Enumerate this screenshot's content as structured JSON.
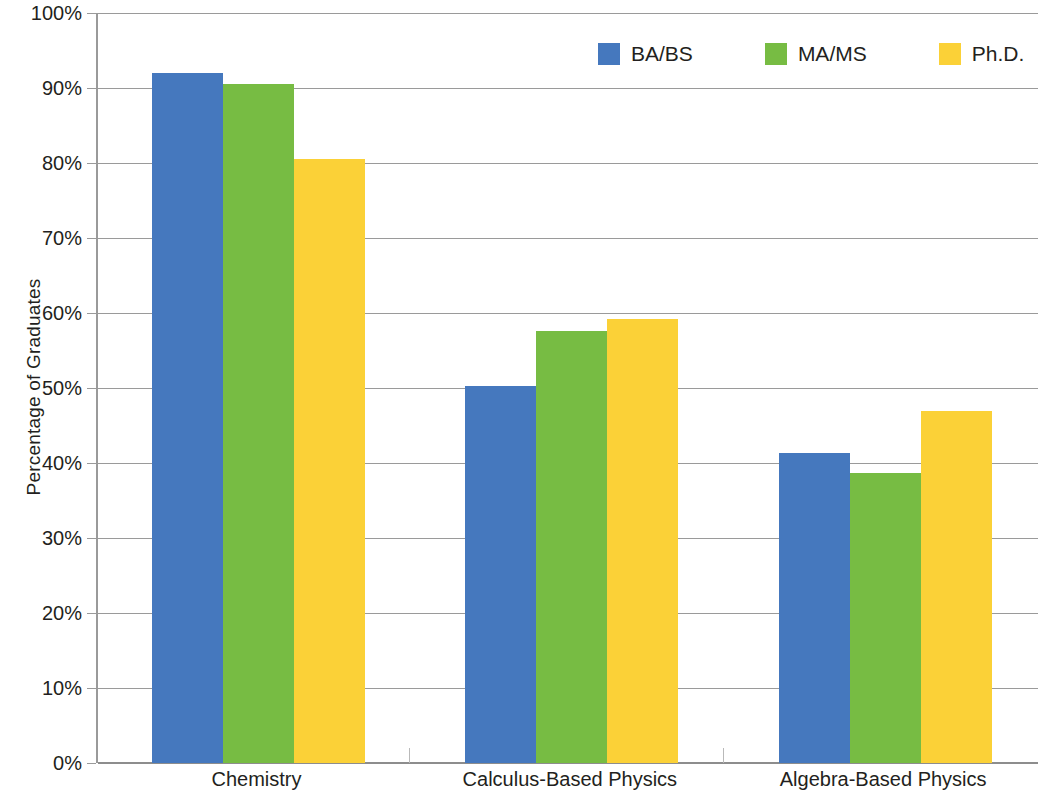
{
  "chart_data": {
    "type": "bar",
    "title": "",
    "subtitle": "",
    "xlabel": "",
    "ylabel": "Percentage of Graduates",
    "categories": [
      "Chemistry",
      "Calculus-Based Physics",
      "Algebra-Based Physics"
    ],
    "series": [
      {
        "name": "BA/BS",
        "color": "#4578be",
        "values": [
          92.0,
          50.3,
          41.4
        ]
      },
      {
        "name": "MA/MS",
        "color": "#77bc43",
        "values": [
          90.5,
          57.6,
          38.7
        ]
      },
      {
        "name": "Ph.D.",
        "color": "#fbd137",
        "values": [
          80.5,
          59.2,
          47.0
        ]
      }
    ],
    "ylim": [
      0,
      100
    ],
    "ytick_step": 10,
    "ytick_labels": [
      "0%",
      "10%",
      "20%",
      "30%",
      "40%",
      "50%",
      "60%",
      "70%",
      "80%",
      "90%",
      "100%"
    ],
    "grid": "horizontal",
    "legend_position": "top-right",
    "value_unit": "%"
  },
  "axes": {
    "y_title": "Percentage of Graduates"
  },
  "legend": {
    "items": [
      {
        "label": "BA/BS"
      },
      {
        "label": "MA/MS"
      },
      {
        "label": "Ph.D."
      }
    ]
  }
}
